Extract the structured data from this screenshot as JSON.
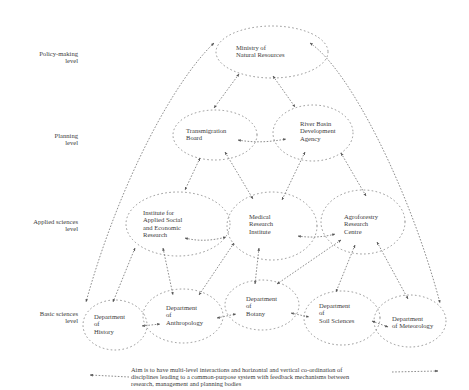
{
  "levels": [
    {
      "line1": "Policy-making",
      "line2": "level"
    },
    {
      "line1": "Planning",
      "line2": "level"
    },
    {
      "line1": "Applied sciences",
      "line2": "level"
    },
    {
      "line1": "Basic sciences",
      "line2": "level"
    }
  ],
  "nodes": {
    "ministry": {
      "lines": [
        "Ministry of",
        "Natural Resources"
      ]
    },
    "transmigration": {
      "lines": [
        "Transmigration",
        "Board"
      ]
    },
    "river_basin": {
      "lines": [
        "River Basin",
        "Development",
        "Agency"
      ]
    },
    "institute_social": {
      "lines": [
        "Institute for",
        "Applied Social",
        "and Economic",
        "Research"
      ]
    },
    "medical": {
      "lines": [
        "Medical",
        "Research",
        "Institute"
      ]
    },
    "agroforestry": {
      "lines": [
        "Agroforestry",
        "Research",
        "Centre"
      ]
    },
    "history": {
      "lines": [
        "Department",
        "of",
        "History"
      ]
    },
    "anthropology": {
      "lines": [
        "Department",
        "of",
        "Anthropology"
      ]
    },
    "botany": {
      "lines": [
        "Department",
        "of",
        "Botany"
      ]
    },
    "soil": {
      "lines": [
        "Department",
        "of",
        "Soil Sciences"
      ]
    },
    "meteorology": {
      "lines": [
        "Department",
        "of Meteorology"
      ]
    }
  },
  "caption": {
    "lines": [
      "Aim is to have multi-level interactions and horizontal and vertical co-ordination of",
      "disciplines leading to a common-purpose system with feedback mechanisms between",
      "research, management and planning bodies"
    ]
  },
  "colors": {
    "line": "#7a7a7a",
    "text": "#3c3c3c",
    "background": "#ffffff"
  }
}
